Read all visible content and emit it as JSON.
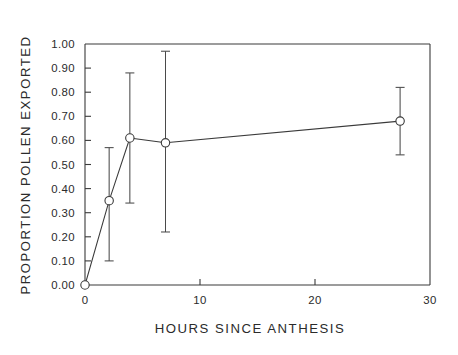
{
  "chart_data": {
    "type": "line",
    "title": "",
    "subtitle": "",
    "xlabel": "HOURS SINCE ANTHESIS",
    "ylabel": "PROPORTION POLLEN EXPORTED",
    "xlim": [
      0,
      30
    ],
    "ylim": [
      0.0,
      1.0
    ],
    "grid": false,
    "legend": null,
    "xticks": [
      0,
      10,
      20,
      30
    ],
    "xtick_labels": [
      "0",
      "10",
      "20",
      "30"
    ],
    "yticks": [
      0.0,
      0.1,
      0.2,
      0.3,
      0.4,
      0.5,
      0.6,
      0.7,
      0.8,
      0.9,
      1.0
    ],
    "ytick_labels": [
      "0.00",
      "0.10",
      "0.20",
      "0.30",
      "0.40",
      "0.50",
      "0.60",
      "0.70",
      "0.80",
      "0.90",
      "1.00"
    ],
    "marker": "open-circle",
    "line_color": "#3a3a3a",
    "marker_face_color": "#ffffff",
    "marker_edge_color": "#3a3a3a",
    "error_bar_color": "#4a4a4a",
    "series": [
      {
        "name": "Proportion pollen exported",
        "x": [
          0.0,
          2.1,
          3.9,
          7.0,
          27.4
        ],
        "y": [
          0.0,
          0.35,
          0.61,
          0.59,
          0.68
        ],
        "yerr_low": [
          0.0,
          0.1,
          0.34,
          0.22,
          0.54
        ],
        "yerr_high": [
          0.0,
          0.57,
          0.88,
          0.97,
          0.82
        ],
        "has_errorbar": [
          false,
          true,
          true,
          true,
          true
        ]
      }
    ]
  },
  "axes": {
    "x_title": "HOURS SINCE ANTHESIS",
    "y_title": "PROPORTION POLLEN EXPORTED"
  }
}
